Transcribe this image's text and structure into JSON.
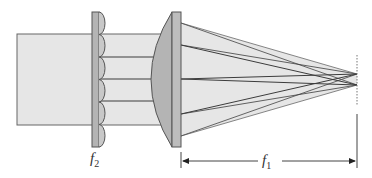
{
  "diagram": {
    "labels": {
      "f2": {
        "base": "f",
        "sub": "2"
      },
      "f1": {
        "base": "f",
        "sub": "1"
      }
    },
    "colors": {
      "beam_fill": "#e6e6e6",
      "lens_fill": "#b4b4b4",
      "stroke": "#555555",
      "ray": "#3c3c3c"
    },
    "components": [
      "input-beam",
      "microlens-array",
      "condenser-lens",
      "focal-plane"
    ]
  }
}
